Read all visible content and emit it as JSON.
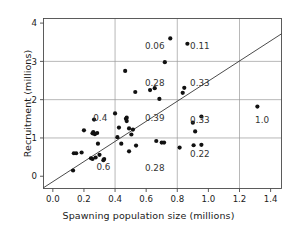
{
  "chart_data": {
    "type": "scatter",
    "title": "",
    "xlabel": "Spawning population size (millions)",
    "ylabel": "Recruitment (millions)",
    "xlim": [
      -0.06,
      1.47
    ],
    "ylim": [
      -0.32,
      4.12
    ],
    "xticks": [
      0.0,
      0.2,
      0.4,
      0.6,
      0.8,
      1.0,
      1.2,
      1.4
    ],
    "xticklabels": [
      "0.0",
      "0.2",
      "0.4",
      "0.6",
      "0.8",
      "1.0",
      "1.2",
      "1.4"
    ],
    "yticks": [
      0,
      1,
      2,
      3,
      4
    ],
    "yticklabels": [
      "0",
      "1",
      "2",
      "3",
      "4"
    ],
    "grid": true,
    "grid_x": [
      0.4,
      0.8,
      1.2
    ],
    "grid_y": [
      1,
      2,
      3
    ],
    "legend": "none",
    "marker": "filled-circle",
    "marker_color": "#111111",
    "points": [
      {
        "x": 0.13,
        "y": 0.15
      },
      {
        "x": 0.135,
        "y": 0.6
      },
      {
        "x": 0.15,
        "y": 0.6
      },
      {
        "x": 0.185,
        "y": 0.62
      },
      {
        "x": 0.2,
        "y": 1.2
      },
      {
        "x": 0.245,
        "y": 0.47
      },
      {
        "x": 0.255,
        "y": 1.12
      },
      {
        "x": 0.26,
        "y": 1.15
      },
      {
        "x": 0.255,
        "y": 0.45
      },
      {
        "x": 0.265,
        "y": 1.48
      },
      {
        "x": 0.27,
        "y": 1.1
      },
      {
        "x": 0.275,
        "y": 0.49
      },
      {
        "x": 0.285,
        "y": 1.13
      },
      {
        "x": 0.29,
        "y": 0.85
      },
      {
        "x": 0.3,
        "y": 0.56
      },
      {
        "x": 0.325,
        "y": 0.42
      },
      {
        "x": 0.33,
        "y": 0.45
      },
      {
        "x": 0.4,
        "y": 1.64
      },
      {
        "x": 0.415,
        "y": 1.02
      },
      {
        "x": 0.425,
        "y": 1.27
      },
      {
        "x": 0.44,
        "y": 0.85
      },
      {
        "x": 0.465,
        "y": 2.75
      },
      {
        "x": 0.47,
        "y": 1.5
      },
      {
        "x": 0.475,
        "y": 1.44
      },
      {
        "x": 0.475,
        "y": 1.53
      },
      {
        "x": 0.49,
        "y": 1.25
      },
      {
        "x": 0.49,
        "y": 0.65
      },
      {
        "x": 0.505,
        "y": 1.09
      },
      {
        "x": 0.515,
        "y": 1.22
      },
      {
        "x": 0.53,
        "y": 2.2
      },
      {
        "x": 0.535,
        "y": 0.8
      },
      {
        "x": 0.625,
        "y": 2.25
      },
      {
        "x": 0.655,
        "y": 2.3
      },
      {
        "x": 0.665,
        "y": 0.92
      },
      {
        "x": 0.685,
        "y": 2.02
      },
      {
        "x": 0.7,
        "y": 0.88
      },
      {
        "x": 0.715,
        "y": 0.88
      },
      {
        "x": 0.72,
        "y": 2.98
      },
      {
        "x": 0.755,
        "y": 3.6
      },
      {
        "x": 0.815,
        "y": 0.75
      },
      {
        "x": 0.835,
        "y": 2.18
      },
      {
        "x": 0.845,
        "y": 2.31
      },
      {
        "x": 0.865,
        "y": 3.46
      },
      {
        "x": 0.9,
        "y": 1.4
      },
      {
        "x": 0.905,
        "y": 0.81
      },
      {
        "x": 0.915,
        "y": 1.17
      },
      {
        "x": 0.955,
        "y": 1.56
      },
      {
        "x": 0.955,
        "y": 0.82
      },
      {
        "x": 1.315,
        "y": 1.82
      }
    ],
    "reference_line": {
      "name": "replacement-line",
      "x0": -0.06,
      "y0": -0.3,
      "x1": 1.47,
      "y1": 3.72,
      "color": "#2b2b2b"
    },
    "cell_annotations": [
      {
        "label": "0.06",
        "x": 0.655,
        "y": 3.32
      },
      {
        "label": "0.11",
        "x": 0.945,
        "y": 3.32
      },
      {
        "label": "0.28",
        "x": 0.655,
        "y": 2.37
      },
      {
        "label": "0.33",
        "x": 0.945,
        "y": 2.37
      },
      {
        "label": "0.4",
        "x": 0.305,
        "y": 1.44
      },
      {
        "label": "0.39",
        "x": 0.655,
        "y": 1.44
      },
      {
        "label": "0.33",
        "x": 0.945,
        "y": 1.38
      },
      {
        "label": "1.0",
        "x": 1.345,
        "y": 1.38
      },
      {
        "label": "0.6",
        "x": 0.325,
        "y": 0.16
      },
      {
        "label": "0.28",
        "x": 0.655,
        "y": 0.15
      },
      {
        "label": "0.22",
        "x": 0.945,
        "y": 0.5
      }
    ]
  }
}
